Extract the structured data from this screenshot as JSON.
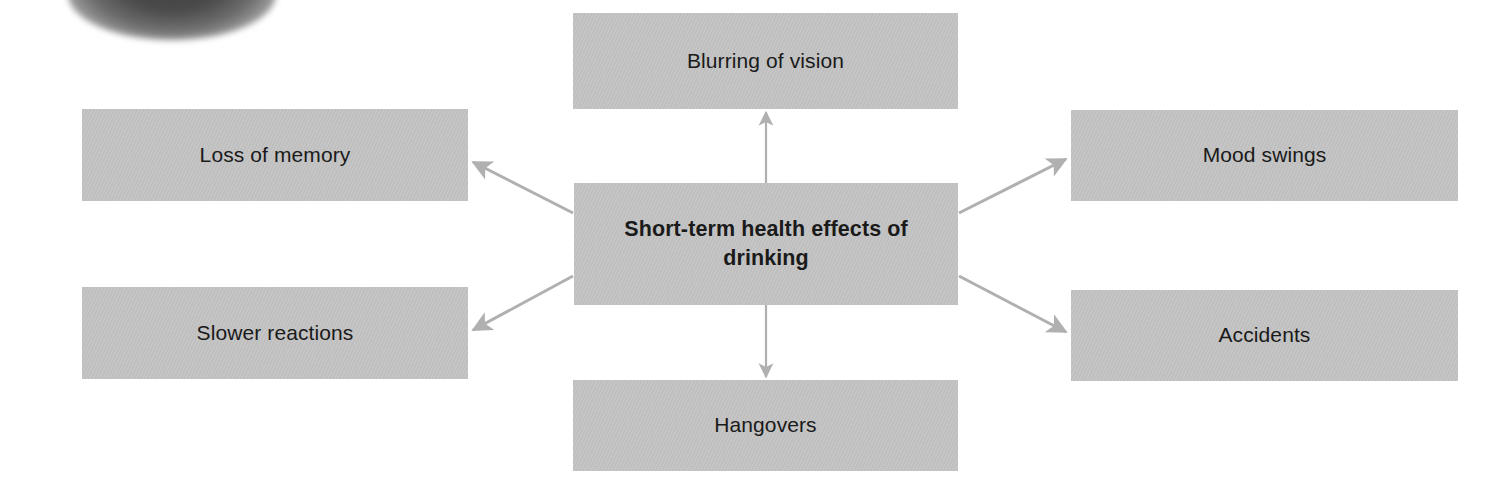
{
  "diagram": {
    "type": "spider-map",
    "center": {
      "id": "center",
      "label": "Short-term health effects of drinking"
    },
    "nodes": [
      {
        "id": "blurring-of-vision",
        "label": "Blurring of vision"
      },
      {
        "id": "loss-of-memory",
        "label": "Loss of memory"
      },
      {
        "id": "mood-swings",
        "label": "Mood swings"
      },
      {
        "id": "slower-reactions",
        "label": "Slower reactions"
      },
      {
        "id": "accidents",
        "label": "Accidents"
      },
      {
        "id": "hangovers",
        "label": "Hangovers"
      }
    ],
    "edges": [
      {
        "from": "center",
        "to": "blurring-of-vision",
        "direction": "up"
      },
      {
        "from": "center",
        "to": "loss-of-memory",
        "direction": "up-left"
      },
      {
        "from": "center",
        "to": "mood-swings",
        "direction": "up-right"
      },
      {
        "from": "center",
        "to": "slower-reactions",
        "direction": "down-left"
      },
      {
        "from": "center",
        "to": "accidents",
        "direction": "down-right"
      },
      {
        "from": "center",
        "to": "hangovers",
        "direction": "down"
      }
    ],
    "colors": {
      "box_fill": "#c3c3c3",
      "text": "#1a1a1a",
      "arrow": "#b0b0b0",
      "background": "#ffffff"
    }
  }
}
